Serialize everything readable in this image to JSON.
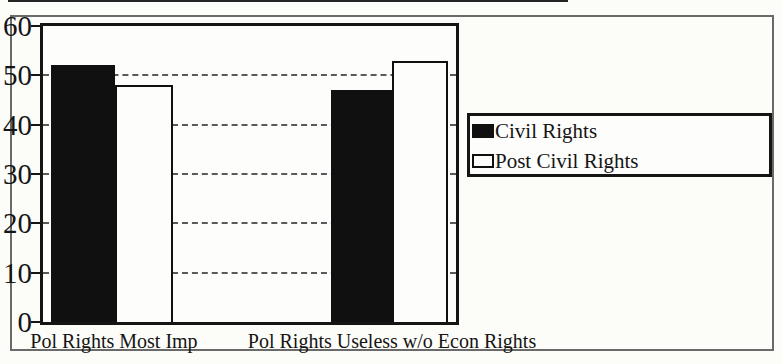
{
  "chart_data": {
    "type": "bar",
    "title": "",
    "categories": [
      "Pol Rights Most Imp",
      "Pol Rights Useless w/o Econ Rights"
    ],
    "series": [
      {
        "name": "Civil Rights",
        "fill": "#101010",
        "values": [
          52,
          47
        ]
      },
      {
        "name": "Post Civil Rights",
        "fill": "#fdfdfb",
        "values": [
          48,
          53
        ]
      }
    ],
    "ylim": [
      0,
      60
    ],
    "yticks": [
      0,
      10,
      20,
      30,
      40,
      50,
      60
    ],
    "gridline_values": [
      10,
      20,
      30,
      40,
      50
    ],
    "grid_style": "dashed",
    "xlabel": "",
    "ylabel": "",
    "legend_position": "right",
    "legend_entries": [
      "Civil Rights",
      "Post Civil Rights"
    ]
  },
  "colors": {
    "ink": "#151515",
    "grid": "#5a5a5a",
    "paper": "#fcfcf8",
    "outer_border": "#6a6a6a"
  }
}
